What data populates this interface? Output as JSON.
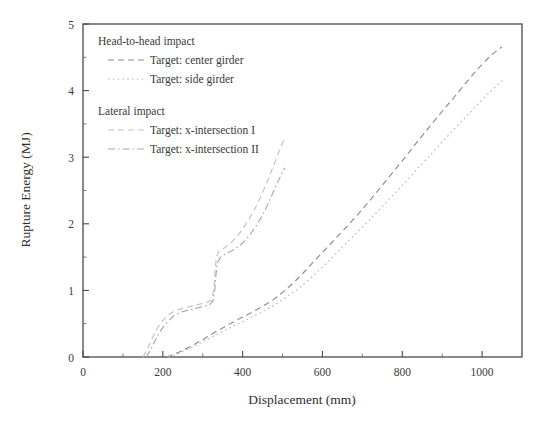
{
  "chart_data": {
    "type": "line",
    "title": "",
    "xlabel": "Displacement (mm)",
    "ylabel": "Rupture Energy (MJ)",
    "xlim": [
      0,
      1100
    ],
    "ylim": [
      0,
      5
    ],
    "xticks": [
      0,
      200,
      400,
      600,
      800,
      1000
    ],
    "xtick_labels": [
      "0",
      "200",
      "400",
      "600",
      "800",
      "1000"
    ],
    "xticks_minor": [
      100,
      300,
      500,
      700,
      900,
      1100
    ],
    "yticks": [
      0,
      1,
      2,
      3,
      4,
      5
    ],
    "ytick_labels": [
      "0",
      "1",
      "2",
      "3",
      "4",
      "5"
    ],
    "yticks_minor": [
      0.5,
      1.5,
      2.5,
      3.5,
      4.5
    ],
    "grid": false,
    "legend_position": "upper-left-inside",
    "series": [
      {
        "name": "Target: center girder",
        "group": "Head-to-head impact",
        "style": "dashed",
        "color": "#8d8d8d",
        "points": [
          [
            210,
            0.0
          ],
          [
            240,
            0.07
          ],
          [
            270,
            0.16
          ],
          [
            300,
            0.26
          ],
          [
            330,
            0.37
          ],
          [
            360,
            0.47
          ],
          [
            390,
            0.57
          ],
          [
            420,
            0.66
          ],
          [
            450,
            0.76
          ],
          [
            470,
            0.83
          ],
          [
            490,
            0.92
          ],
          [
            510,
            1.02
          ],
          [
            530,
            1.13
          ],
          [
            550,
            1.25
          ],
          [
            570,
            1.38
          ],
          [
            600,
            1.57
          ],
          [
            630,
            1.76
          ],
          [
            660,
            1.95
          ],
          [
            690,
            2.15
          ],
          [
            720,
            2.36
          ],
          [
            750,
            2.58
          ],
          [
            780,
            2.8
          ],
          [
            810,
            3.02
          ],
          [
            840,
            3.25
          ],
          [
            870,
            3.47
          ],
          [
            900,
            3.69
          ],
          [
            930,
            3.9
          ],
          [
            960,
            4.12
          ],
          [
            990,
            4.33
          ],
          [
            1020,
            4.52
          ],
          [
            1050,
            4.66
          ]
        ]
      },
      {
        "name": "Target: side girder",
        "group": "Head-to-head impact",
        "style": "dotted",
        "color": "#bdbdbd",
        "points": [
          [
            215,
            0.0
          ],
          [
            250,
            0.08
          ],
          [
            285,
            0.18
          ],
          [
            320,
            0.29
          ],
          [
            355,
            0.4
          ],
          [
            390,
            0.5
          ],
          [
            420,
            0.59
          ],
          [
            450,
            0.68
          ],
          [
            480,
            0.78
          ],
          [
            510,
            0.9
          ],
          [
            540,
            1.03
          ],
          [
            570,
            1.18
          ],
          [
            600,
            1.35
          ],
          [
            630,
            1.53
          ],
          [
            660,
            1.71
          ],
          [
            690,
            1.89
          ],
          [
            720,
            2.07
          ],
          [
            750,
            2.26
          ],
          [
            780,
            2.45
          ],
          [
            810,
            2.64
          ],
          [
            840,
            2.84
          ],
          [
            870,
            3.03
          ],
          [
            900,
            3.23
          ],
          [
            930,
            3.42
          ],
          [
            960,
            3.61
          ],
          [
            990,
            3.8
          ],
          [
            1020,
            3.98
          ],
          [
            1050,
            4.15
          ]
        ]
      },
      {
        "name": "Target: x-intersection I",
        "group": "Lateral impact",
        "style": "dashed",
        "color": "#c2c2c2",
        "points": [
          [
            150,
            0.0
          ],
          [
            160,
            0.1
          ],
          [
            172,
            0.26
          ],
          [
            185,
            0.42
          ],
          [
            200,
            0.55
          ],
          [
            215,
            0.64
          ],
          [
            232,
            0.7
          ],
          [
            250,
            0.73
          ],
          [
            270,
            0.76
          ],
          [
            290,
            0.79
          ],
          [
            310,
            0.82
          ],
          [
            322,
            0.85
          ],
          [
            328,
            1.02
          ],
          [
            331,
            1.28
          ],
          [
            334,
            1.5
          ],
          [
            340,
            1.58
          ],
          [
            352,
            1.63
          ],
          [
            368,
            1.7
          ],
          [
            385,
            1.8
          ],
          [
            400,
            1.92
          ],
          [
            415,
            2.06
          ],
          [
            430,
            2.22
          ],
          [
            445,
            2.4
          ],
          [
            458,
            2.58
          ],
          [
            470,
            2.76
          ],
          [
            482,
            2.94
          ],
          [
            492,
            3.1
          ],
          [
            500,
            3.22
          ],
          [
            508,
            3.3
          ]
        ]
      },
      {
        "name": "Target: x-intersection II",
        "group": "Lateral impact",
        "style": "dash-dot",
        "color": "#a8a8a8",
        "points": [
          [
            158,
            0.0
          ],
          [
            168,
            0.09
          ],
          [
            180,
            0.24
          ],
          [
            195,
            0.4
          ],
          [
            210,
            0.52
          ],
          [
            226,
            0.61
          ],
          [
            243,
            0.67
          ],
          [
            262,
            0.7
          ],
          [
            282,
            0.73
          ],
          [
            302,
            0.76
          ],
          [
            318,
            0.79
          ],
          [
            326,
            0.84
          ],
          [
            330,
            1.0
          ],
          [
            333,
            1.22
          ],
          [
            337,
            1.42
          ],
          [
            345,
            1.5
          ],
          [
            358,
            1.55
          ],
          [
            374,
            1.6
          ],
          [
            390,
            1.66
          ],
          [
            405,
            1.74
          ],
          [
            420,
            1.85
          ],
          [
            435,
            1.98
          ],
          [
            450,
            2.13
          ],
          [
            462,
            2.28
          ],
          [
            474,
            2.44
          ],
          [
            486,
            2.6
          ],
          [
            497,
            2.74
          ],
          [
            505,
            2.84
          ]
        ]
      }
    ],
    "legend": {
      "groups": [
        {
          "heading": "Head-to-head impact",
          "entries": [
            {
              "label": "Target: center girder",
              "style": "dashed",
              "color": "#8d8d8d"
            },
            {
              "label": "Target: side girder",
              "style": "dotted",
              "color": "#c9c9c9"
            }
          ]
        },
        {
          "heading": "Lateral impact",
          "entries": [
            {
              "label": "Target: x-intersection I",
              "style": "dashed",
              "color": "#c2c2c2"
            },
            {
              "label": "Target: x-intersection II",
              "style": "dash-dot",
              "color": "#a8a8a8"
            }
          ]
        }
      ]
    }
  }
}
